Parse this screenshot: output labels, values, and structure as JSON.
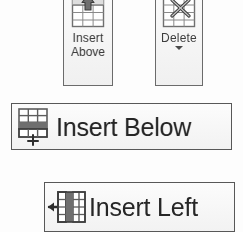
{
  "palette": {
    "page_background": "#fdfdfd",
    "button_face": "#f4f4f4",
    "button_border": "#6b6b6b",
    "caption_text": "#3d3d3d",
    "label_text": "#262626",
    "grid_line": "#7a7a7a",
    "grid_fill": "#ffffff",
    "highlight_fill": "#8a8a8a",
    "arrow_fill": "#4a4a4a"
  },
  "toolbar": {
    "name": "table-row-column-tools",
    "buttons": [
      {
        "id": "insert-above",
        "style": "large",
        "caption_line1": "Insert",
        "caption_line2": "Above",
        "icon": "table-insert-row-above-icon",
        "has_dropdown": false
      },
      {
        "id": "delete",
        "style": "large",
        "caption_line1": "Delete",
        "caption_line2": "",
        "icon": "table-delete-icon",
        "has_dropdown": true,
        "dropdown_glyph": "▼"
      },
      {
        "id": "insert-below",
        "style": "wide",
        "label": "Insert Below",
        "icon": "table-insert-row-below-icon",
        "has_dropdown": false
      },
      {
        "id": "insert-left",
        "style": "wide",
        "label": "Insert Left",
        "icon": "table-insert-column-left-icon",
        "has_dropdown": false
      }
    ]
  }
}
